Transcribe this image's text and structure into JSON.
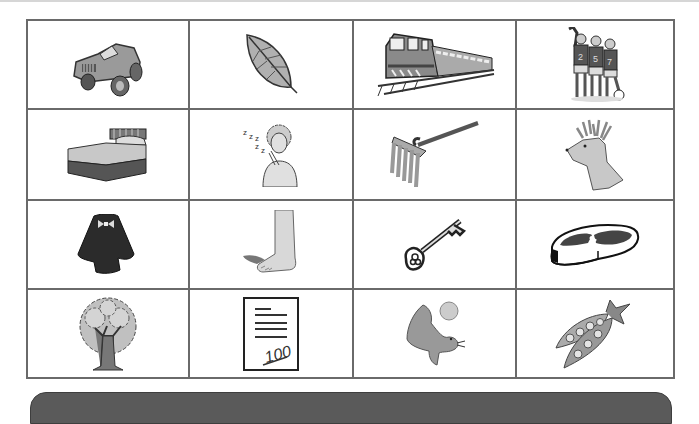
{
  "worksheet": {
    "grid": {
      "rows": 4,
      "columns": 4,
      "cells": [
        {
          "icon": "jeep-icon",
          "label": "jeep"
        },
        {
          "icon": "leaf-icon",
          "label": "leaf"
        },
        {
          "icon": "train-icon",
          "label": "train"
        },
        {
          "icon": "team-icon",
          "label": "team"
        },
        {
          "icon": "bed-icon",
          "label": "bed"
        },
        {
          "icon": "sleep-icon",
          "label": "sleep"
        },
        {
          "icon": "rake-icon",
          "label": "rake"
        },
        {
          "icon": "deer-icon",
          "label": "deer"
        },
        {
          "icon": "cape-icon",
          "label": "cape"
        },
        {
          "icon": "foot-icon",
          "label": "foot"
        },
        {
          "icon": "key-icon",
          "label": "key"
        },
        {
          "icon": "meat-icon",
          "label": "meat"
        },
        {
          "icon": "tree-icon",
          "label": "tree"
        },
        {
          "icon": "test-paper-icon",
          "label": "test"
        },
        {
          "icon": "seal-icon",
          "label": "seal"
        },
        {
          "icon": "peas-icon",
          "label": "peas"
        }
      ]
    },
    "sleep_text": "z z z z z",
    "jersey_numbers": [
      "2",
      "5",
      "7"
    ],
    "paper_score": "100",
    "colors": {
      "grid_line": "#6a6a6a",
      "illustration_gray": "#9a9a9a",
      "dark_gray": "#3a3a3a",
      "bottom_bar": "#5a5a5a"
    }
  }
}
